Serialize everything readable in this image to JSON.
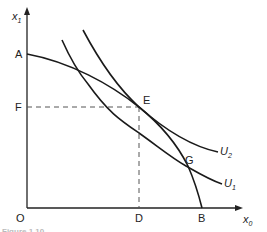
{
  "diagram": {
    "type": "economics-ppf-indifference",
    "axes": {
      "y_label": "x",
      "y_label_sub": "1",
      "x_label": "x",
      "x_label_sub": "0",
      "origin_label": "O"
    },
    "points": {
      "A": "A",
      "F": "F",
      "E": "E",
      "G": "G",
      "D": "D",
      "B": "B"
    },
    "curves": {
      "ppf": "production possibility frontier AB",
      "u2_label": "U",
      "u2_sub": "2",
      "u1_label": "U",
      "u1_sub": "1"
    },
    "caption": "Figure 1.10",
    "colors": {
      "line": "#1a1a1a",
      "dashed": "#444444",
      "text": "#222222"
    }
  }
}
